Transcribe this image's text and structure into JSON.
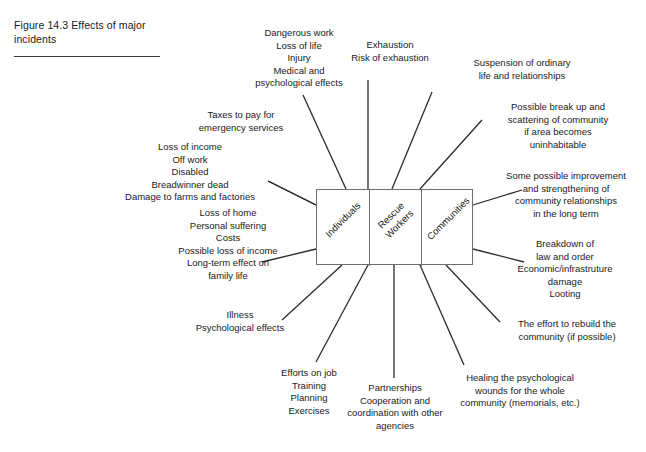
{
  "figure": {
    "caption": "Figure 14.3  Effects of major incidents"
  },
  "core": {
    "cells": [
      {
        "label": "Individuals"
      },
      {
        "label": "Rescue\nWorkers"
      },
      {
        "label": "Communities"
      }
    ],
    "arrows": [
      {
        "name": "arrow-individuals-rescue",
        "glyph": "double-headed-arrow"
      },
      {
        "name": "arrow-rescue-communities",
        "glyph": "double-headed-arrow"
      }
    ]
  },
  "notes": {
    "dangerous_work": "Dangerous work\nLoss of life\nInjury\nMedical and\npsychological effects",
    "exhaustion": "Exhaustion\nRisk of exhaustion",
    "suspension": "Suspension of ordinary\nlife and  relationships",
    "break_up": "Possible break up and\nscattering of community\nif area becomes\nuninhabitable",
    "taxes": "Taxes to pay for\nemergency services",
    "loss_of_income": "Loss of income\nOff work\nDisabled\nBreadwinner dead\nDamage to farms and factories",
    "improvement": "Some possible improvement\nand strengthening of\ncommunity relationships\nin the long term",
    "loss_of_home": "Loss of home\nPersonal suffering\nCosts\nPossible loss of income\nLong-term effect on\nfamily life",
    "breakdown": "Breakdown of\nlaw and order\nEconomic/infrastruture\ndamage\nLooting",
    "illness": "Illness\nPsychological effects",
    "rebuild": "The effort to rebuild the\ncommunity (if possible)",
    "efforts_on_job": "Efforts on job\nTraining\nPlanning\nExercises",
    "partnerships": "Partnerships\nCooperation and\ncoordination with other\nagencies",
    "healing": "Healing the psychological\nwounds for the whole\ncommunity (memorials, etc.)"
  },
  "colors": {
    "line": "#2b2b2b",
    "box_border": "#6e6e6e",
    "text": "#1a1a1a",
    "background": "#ffffff"
  }
}
